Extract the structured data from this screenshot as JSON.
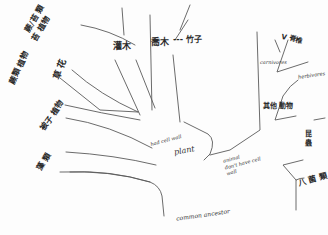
{
  "diagram": {
    "type": "hand-drawn phylogenetic tree sketch",
    "stroke_color": "#5a5a5a",
    "background": "#fdfdfd",
    "root": {
      "label": "common ancestor"
    },
    "branches": {
      "plant": {
        "label": "plant",
        "note": "had cell wall",
        "leaves": [
          {
            "id": "bryophyte_fern",
            "label": "蕨/苔 類"
          },
          {
            "id": "moss",
            "label": "苔 植物"
          },
          {
            "id": "fern_plants",
            "label": "蕨類 植物"
          },
          {
            "id": "flowers",
            "label": "草 花"
          },
          {
            "id": "seed_plant",
            "label": "被子 植物"
          },
          {
            "id": "algae",
            "label": "藻 類"
          },
          {
            "id": "shrub",
            "label": "灌木"
          },
          {
            "id": "tree",
            "label": "喬木"
          },
          {
            "id": "tree_extra",
            "label": "--- 竹子"
          }
        ]
      },
      "animal": {
        "label": "animal",
        "note": "don't have cell wall",
        "leaves": [
          {
            "id": "vertebrate",
            "label": "V 脊椎"
          },
          {
            "id": "carnivores",
            "label": "carnivores"
          },
          {
            "id": "herbivores",
            "label": "herbivores"
          },
          {
            "id": "other_animal",
            "label": "其他 動物"
          },
          {
            "id": "insect",
            "label": "昆 蟲"
          },
          {
            "id": "fungus",
            "label": "八 菌 類"
          }
        ]
      }
    }
  }
}
